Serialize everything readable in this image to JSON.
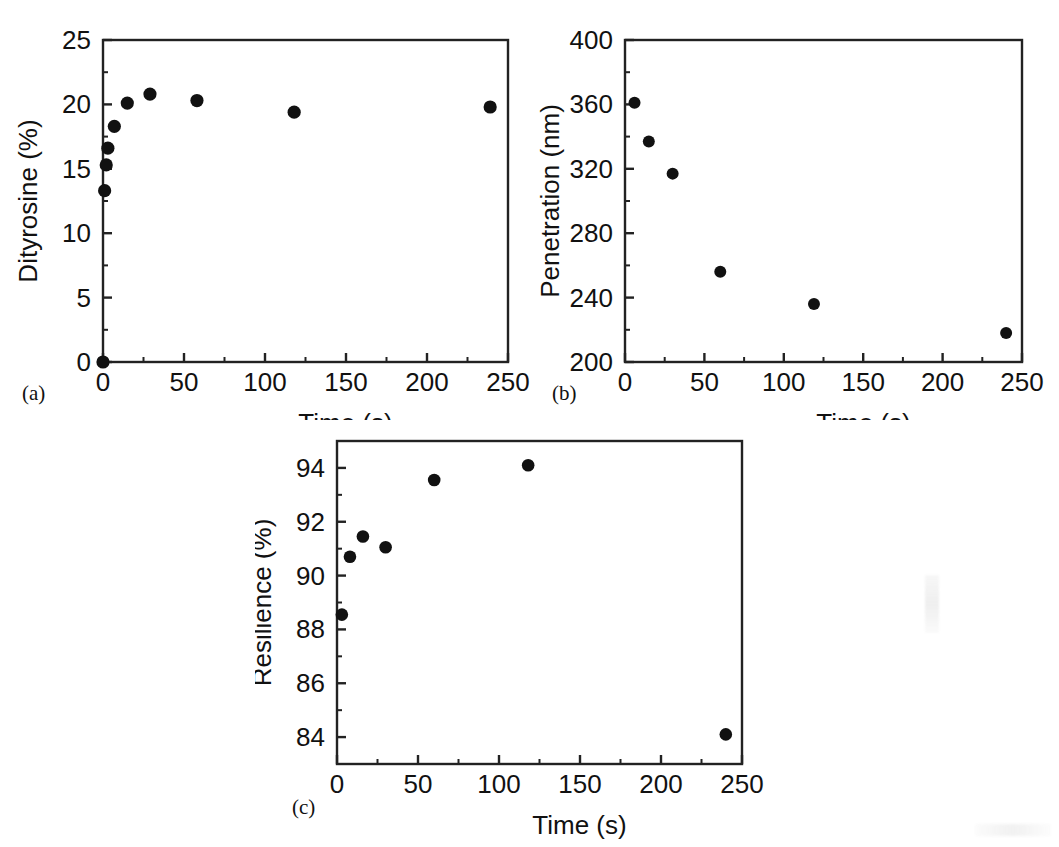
{
  "figure": {
    "background_color": "#ffffff",
    "marker_color": "#111111",
    "axis_color": "#222222",
    "panel_count": 3
  },
  "panels": [
    {
      "tag": "(a)",
      "name": "dityrosine-vs-time"
    },
    {
      "tag": "(b)",
      "name": "penetration-vs-time"
    },
    {
      "tag": "(c)",
      "name": "resilience-vs-time"
    }
  ],
  "chart_data": [
    {
      "type": "scatter",
      "panel": "(a)",
      "title": "",
      "xlabel": "Time (s)",
      "ylabel": "Dityrosine (%)",
      "xlim": [
        0,
        250
      ],
      "ylim": [
        0,
        25
      ],
      "xticks": [
        0,
        50,
        100,
        150,
        200,
        250
      ],
      "xtick_labels": [
        "0",
        "50",
        "100",
        "150",
        "200",
        "250"
      ],
      "yticks": [
        0,
        5,
        10,
        15,
        20,
        25
      ],
      "ytick_labels": [
        "0",
        "5",
        "10",
        "15",
        "20",
        "25"
      ],
      "minor_xtick_step": 25,
      "minor_ytick_step": 2.5,
      "grid": false,
      "legend": false,
      "marker": "filled-circle",
      "x": [
        0,
        1,
        2,
        3,
        7,
        15,
        29,
        58,
        118,
        239
      ],
      "y": [
        0.0,
        13.3,
        15.3,
        16.6,
        18.3,
        20.1,
        20.8,
        20.3,
        19.4,
        19.8
      ]
    },
    {
      "type": "scatter",
      "panel": "(b)",
      "title": "",
      "xlabel": "Time (s)",
      "ylabel": "Penetration (nm)",
      "xlim": [
        0,
        250
      ],
      "ylim": [
        200,
        400
      ],
      "xticks": [
        0,
        50,
        100,
        150,
        200,
        250
      ],
      "xtick_labels": [
        "0",
        "50",
        "100",
        "150",
        "200",
        "250"
      ],
      "yticks": [
        200,
        240,
        280,
        320,
        360,
        400
      ],
      "ytick_labels": [
        "200",
        "240",
        "280",
        "320",
        "360",
        "400"
      ],
      "minor_xtick_step": 25,
      "minor_ytick_step": 20,
      "grid": false,
      "legend": false,
      "marker": "filled-circle",
      "x": [
        6,
        15,
        30,
        60,
        119,
        240
      ],
      "y": [
        361,
        337,
        317,
        256,
        236,
        218
      ]
    },
    {
      "type": "scatter",
      "panel": "(c)",
      "title": "",
      "xlabel": "Time (s)",
      "ylabel": "Resilience (%)",
      "xlim": [
        0,
        250
      ],
      "ylim": [
        83.0,
        95.0
      ],
      "xticks": [
        0,
        50,
        100,
        150,
        200,
        250
      ],
      "xtick_labels": [
        "0",
        "50",
        "100",
        "150",
        "200",
        "250"
      ],
      "yticks": [
        84,
        86,
        88,
        90,
        92,
        94
      ],
      "ytick_labels": [
        "84",
        "86",
        "88",
        "90",
        "92",
        "94"
      ],
      "minor_xtick_step": 25,
      "minor_ytick_step": 1,
      "grid": false,
      "legend": false,
      "marker": "filled-circle",
      "x": [
        3,
        8,
        16,
        30,
        60,
        118,
        240
      ],
      "y": [
        88.55,
        90.7,
        91.45,
        91.05,
        93.55,
        94.1,
        84.1
      ]
    }
  ]
}
